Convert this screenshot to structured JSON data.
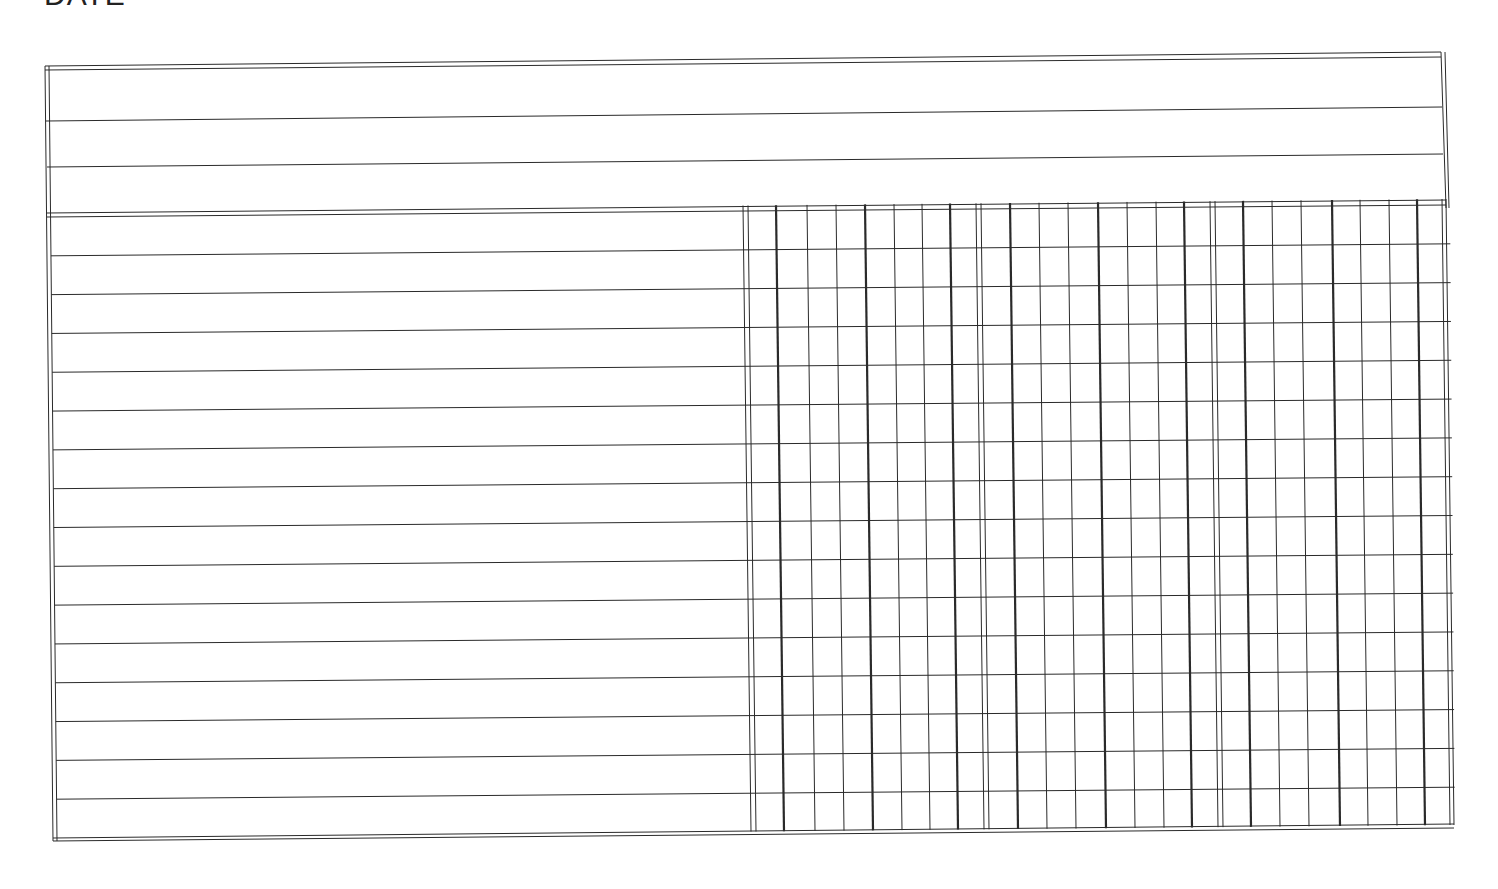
{
  "page": {
    "header_label": "DATE"
  },
  "sheet": {
    "header_rows": 3,
    "body_rows": 16,
    "column_blocks": 3,
    "ink_color": "#2a2a2a",
    "paper_color": "#ffffff"
  }
}
